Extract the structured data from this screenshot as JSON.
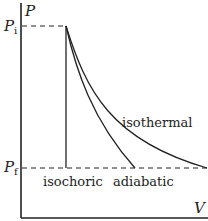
{
  "diagram": {
    "type": "PV diagram",
    "axes": {
      "y_label": "P",
      "x_label": "V"
    },
    "levels": {
      "initial_pressure": {
        "label": "P",
        "subscript": "i"
      },
      "final_pressure": {
        "label": "P",
        "subscript": "f"
      }
    },
    "curves": [
      {
        "name": "isothermal",
        "label": "isothermal"
      },
      {
        "name": "adiabatic",
        "label": "adiabatic"
      },
      {
        "name": "isochoric",
        "label": "isochoric"
      }
    ],
    "colors": {
      "line": "#222222",
      "background": "#ffffff"
    }
  }
}
